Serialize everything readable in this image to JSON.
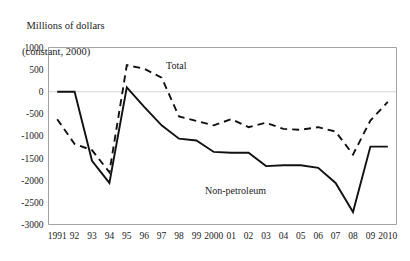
{
  "chart_data": {
    "type": "line",
    "title": "",
    "ylabel_lines": [
      "Millions of dollars",
      "(constant, 2000)"
    ],
    "xlabel": "",
    "ylim": [
      -3000,
      1000
    ],
    "ytick_values": [
      1000,
      500,
      0,
      -500,
      -1000,
      -1500,
      -2000,
      -2500,
      -3000
    ],
    "ytick_labels": [
      "1000",
      "500",
      "0",
      "-500",
      "-1000",
      "-1500",
      "-2000",
      "-2500",
      "-3000"
    ],
    "grid": false,
    "zero_line": true,
    "legend_position": "inline-annotation",
    "categories": [
      "1991",
      "92",
      "93",
      "94",
      "95",
      "96",
      "97",
      "98",
      "99",
      "2000",
      "01",
      "02",
      "03",
      "04",
      "05",
      "06",
      "07",
      "08",
      "09",
      "2010"
    ],
    "x_values": [
      1991,
      1992,
      1993,
      1994,
      1995,
      1996,
      1997,
      1998,
      1999,
      2000,
      2001,
      2002,
      2003,
      2004,
      2005,
      2006,
      2007,
      2008,
      2009,
      2010
    ],
    "series": [
      {
        "name": "Total",
        "style": "dashed",
        "color": "#111111",
        "annotation": "Total",
        "values": [
          -620,
          -1180,
          -1320,
          -1820,
          600,
          520,
          320,
          -560,
          -660,
          -760,
          -620,
          -800,
          -700,
          -840,
          -860,
          -800,
          -900,
          -1420,
          -650,
          -230
        ]
      },
      {
        "name": "Non-petroleum",
        "style": "solid",
        "color": "#111111",
        "annotation": "Non-petroleum",
        "values": [
          0,
          0,
          -1560,
          -2060,
          100,
          -340,
          -760,
          -1060,
          -1100,
          -1360,
          -1380,
          -1380,
          -1680,
          -1660,
          -1660,
          -1720,
          -2060,
          -2720,
          -1240,
          -1240
        ]
      }
    ]
  },
  "annotations": {
    "total_label": "Total",
    "nonpetroleum_label": "Non-petroleum"
  },
  "colors": {
    "line": "#111111",
    "frame": "#8c8c8c",
    "zero_line": "#c8c8c8",
    "text": "#1a1a1a",
    "background": "#ffffff"
  }
}
